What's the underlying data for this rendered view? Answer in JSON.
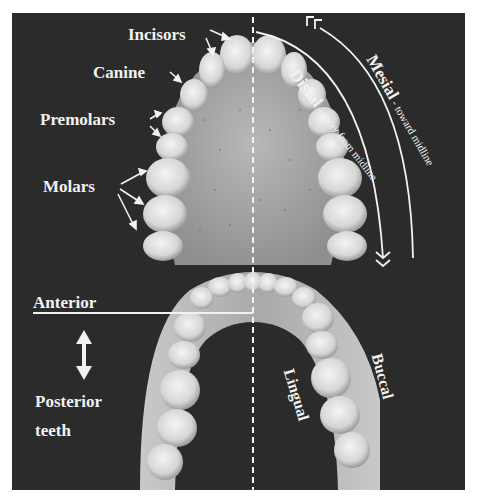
{
  "figure": {
    "background_color": "#2b2b2b",
    "label_color": "#f2f2f2"
  },
  "labels": {
    "incisors": "Incisors",
    "canine": "Canine",
    "premolars": "Premolars",
    "molars": "Molars",
    "anterior": "Anterior",
    "posterior_line1": "Posterior",
    "posterior_line2": "teeth",
    "mesial_term": "Mesial",
    "mesial_desc": " - toward midline",
    "distal_term": "Distal",
    "distal_desc": " - away from midline",
    "lingual": "Lingual",
    "buccal": "Buccal"
  },
  "icons": {
    "mesial_chevrons": "«",
    "distal_chevrons": "»",
    "anterior_posterior_arrow": "↕"
  }
}
